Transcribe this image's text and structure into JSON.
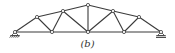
{
  "caption": "(b)",
  "diagram": {
    "type": "truss",
    "nodes": [
      {
        "id": "A",
        "x": 15,
        "y": 32
      },
      {
        "id": "B",
        "x": 52,
        "y": 32
      },
      {
        "id": "C",
        "x": 88,
        "y": 32
      },
      {
        "id": "D",
        "x": 124,
        "y": 32
      },
      {
        "id": "E",
        "x": 161,
        "y": 32
      },
      {
        "id": "F",
        "x": 37,
        "y": 17
      },
      {
        "id": "G",
        "x": 63,
        "y": 11
      },
      {
        "id": "H",
        "x": 88,
        "y": 5
      },
      {
        "id": "I",
        "x": 113,
        "y": 11
      },
      {
        "id": "J",
        "x": 139,
        "y": 17
      }
    ],
    "members": [
      [
        "A",
        "B"
      ],
      [
        "B",
        "C"
      ],
      [
        "C",
        "D"
      ],
      [
        "D",
        "E"
      ],
      [
        "A",
        "F"
      ],
      [
        "F",
        "G"
      ],
      [
        "G",
        "H"
      ],
      [
        "H",
        "I"
      ],
      [
        "I",
        "J"
      ],
      [
        "J",
        "E"
      ],
      [
        "F",
        "B"
      ],
      [
        "B",
        "G"
      ],
      [
        "G",
        "C"
      ],
      [
        "C",
        "H"
      ],
      [
        "C",
        "I"
      ],
      [
        "I",
        "D"
      ],
      [
        "D",
        "J"
      ]
    ],
    "supports": [
      {
        "node": "A",
        "type": "pin"
      },
      {
        "node": "E",
        "type": "roller"
      }
    ],
    "color": "#3a3a3a"
  }
}
